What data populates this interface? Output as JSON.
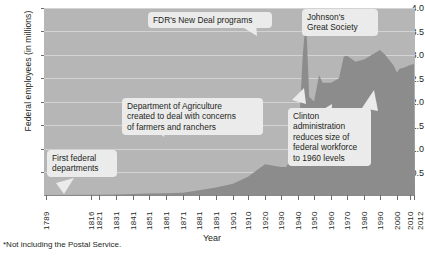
{
  "chart_data": {
    "type": "area",
    "title": "",
    "xlabel": "Year",
    "ylabel": "Federal employees (in millions)",
    "ylim": [
      0,
      4.0
    ],
    "xlim": [
      1789,
      2012
    ],
    "grid": true,
    "legend": null,
    "y_ticks": [
      "4.0",
      "3.5",
      "3.0",
      "2.5",
      "2.0",
      "1.5",
      "1.0",
      "0.5"
    ],
    "y_tick_values": [
      4.0,
      3.5,
      3.0,
      2.5,
      2.0,
      1.5,
      1.0,
      0.5
    ],
    "x_ticks": [
      "1789",
      "1816",
      "1821",
      "1831",
      "1841",
      "1851",
      "1861",
      "1871",
      "1881",
      "1891",
      "1901",
      "1910",
      "1920",
      "1930",
      "1940",
      "1950",
      "1960",
      "1970",
      "1980",
      "1990",
      "2000",
      "2010",
      "2012"
    ],
    "x_tick_values": [
      1789,
      1816,
      1821,
      1831,
      1841,
      1851,
      1861,
      1871,
      1881,
      1891,
      1901,
      1910,
      1920,
      1930,
      1940,
      1950,
      1960,
      1970,
      1980,
      1990,
      2000,
      2010,
      2012
    ],
    "series": [
      {
        "name": "Federal employees (in millions)",
        "color": "#8c8c8c",
        "x": [
          1789,
          1816,
          1821,
          1831,
          1841,
          1851,
          1861,
          1871,
          1881,
          1891,
          1901,
          1910,
          1920,
          1930,
          1933,
          1940,
          1943,
          1945,
          1947,
          1950,
          1953,
          1955,
          1960,
          1965,
          1968,
          1970,
          1975,
          1980,
          1985,
          1990,
          1993,
          1998,
          2000,
          2002,
          2005,
          2010,
          2012
        ],
        "values": [
          0.0,
          0.005,
          0.007,
          0.012,
          0.02,
          0.03,
          0.04,
          0.05,
          0.1,
          0.16,
          0.24,
          0.39,
          0.66,
          0.6,
          0.6,
          1.04,
          3.0,
          3.82,
          2.1,
          2.0,
          2.56,
          2.4,
          2.4,
          2.5,
          2.96,
          2.98,
          2.85,
          2.9,
          3.0,
          3.1,
          3.0,
          2.77,
          2.62,
          2.7,
          2.72,
          2.78,
          2.8
        ],
        "notes": "Flat near zero until ~1871; gradual rise to ~0.66 by 1920; WWII spike to ~3.8 around 1945; post-war drop; Korean War rise; plateau ~2.4-3.1 through 1990; Clinton-era decline; slight uptick after 2000."
      }
    ],
    "annotations": [
      {
        "id": "first-federal-departments",
        "lines": [
          "First federal",
          "departments"
        ],
        "points_to_year": 1789,
        "points_to_value": 0.0
      },
      {
        "id": "department-of-agriculture",
        "lines": [
          "Department of Agriculture",
          "created to deal with concerns",
          "of farmers and ranchers"
        ],
        "points_to_year": 1862,
        "points_to_value": 0.05
      },
      {
        "id": "fdr-new-deal",
        "lines": [
          "FDR's New Deal programs"
        ],
        "points_to_year": 1933,
        "points_to_value": 0.6
      },
      {
        "id": "johnsons-great-society",
        "lines": [
          "Johnson's",
          "Great Society"
        ],
        "points_to_year": 1965,
        "points_to_value": 2.5
      },
      {
        "id": "clinton-administration",
        "lines": [
          "Clinton",
          "administration",
          "reduces size of",
          "federal workforce",
          "to 1960 levels"
        ],
        "points_to_year": 1995,
        "points_to_value": 2.9
      }
    ],
    "footnote": "*Not including the Postal Service.",
    "colors": {
      "plot_background": "#b6b6b6",
      "series_fill": "#8c8c8c",
      "gridline": "#d8d8d8",
      "callout_background": "#ebebeb",
      "text": "#231f20",
      "page_background": "#ffffff"
    }
  }
}
